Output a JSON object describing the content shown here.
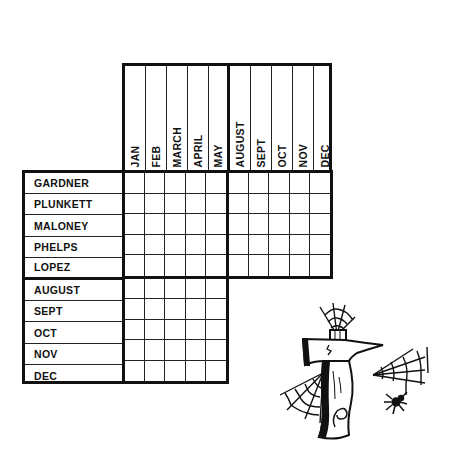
{
  "puzzle": {
    "type": "logic-grid",
    "columns": {
      "group1": [
        "JAN",
        "FEB",
        "MARCH",
        "APRIL",
        "MAY"
      ],
      "group2": [
        "AUGUST",
        "SEPT",
        "OCT",
        "NOV",
        "DEC"
      ]
    },
    "rows": {
      "group1": [
        "GARDNER",
        "PLUNKETT",
        "MALONEY",
        "PHELPS",
        "LOPEZ"
      ],
      "group2": [
        "AUGUST",
        "SEPT",
        "OCT",
        "NOV",
        "DEC"
      ]
    },
    "blocks": [
      {
        "name": "names-vs-months-early",
        "rows": 5,
        "cols": 5
      },
      {
        "name": "names-vs-months-late",
        "rows": 5,
        "cols": 5
      },
      {
        "name": "late-months-vs-early-months",
        "rows": 5,
        "cols": 5
      }
    ]
  },
  "illustration": {
    "icon": "hatchet-with-cobwebs-and-spider-icon",
    "number": "9"
  },
  "colors": {
    "ink": "#111111",
    "background": "#ffffff"
  }
}
